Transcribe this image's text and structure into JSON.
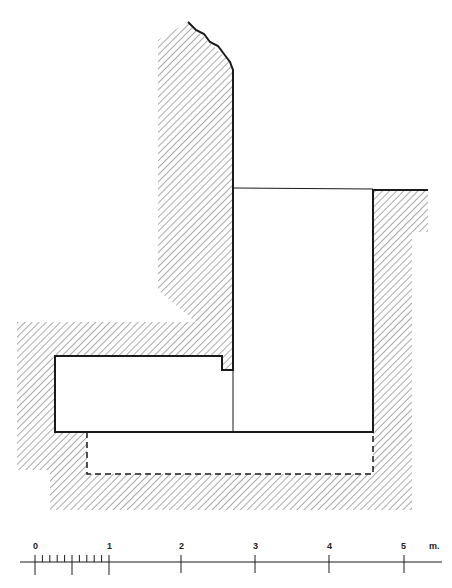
{
  "diagram": {
    "type": "architectural-section",
    "colors": {
      "line": "#1a1a1a",
      "hatch": "#555555",
      "background": "#ffffff"
    }
  },
  "scale_bar": {
    "unit": "m.",
    "ticks": [
      {
        "label": "0",
        "x": 35
      },
      {
        "label": "1",
        "x": 109
      },
      {
        "label": "2",
        "x": 181
      },
      {
        "label": "3",
        "x": 255
      },
      {
        "label": "4",
        "x": 329
      },
      {
        "label": "5",
        "x": 404
      }
    ],
    "subdivisions": 10
  }
}
